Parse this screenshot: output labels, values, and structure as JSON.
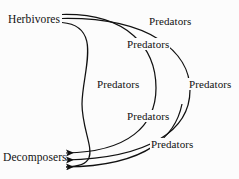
{
  "figure": {
    "background_color": "#fcfcfc",
    "line_color": "#111111",
    "type": "food-chain-diagram"
  },
  "nodes": {
    "source": {
      "label": "Herbivores",
      "x": 8,
      "y": 13
    },
    "sink": {
      "label": "Decomposers",
      "x": 3,
      "y": 152
    }
  },
  "chain_stages": [
    {
      "label": "Predators",
      "x": 148,
      "y": 15
    },
    {
      "label": "Predators",
      "x": 126,
      "y": 38
    },
    {
      "label": "Predators",
      "x": 96,
      "y": 78
    },
    {
      "label": "Predators",
      "x": 188,
      "y": 78
    },
    {
      "label": "Predators",
      "x": 126,
      "y": 110
    },
    {
      "label": "Predators",
      "x": 150,
      "y": 138
    }
  ],
  "arcs": [
    {
      "name": "inner-arc",
      "from": "Herbivores",
      "to": "Decomposers",
      "stages": 1
    },
    {
      "name": "middle-arc",
      "from": "Herbivores",
      "to": "Decomposers",
      "stages": 2
    },
    {
      "name": "outer-arc",
      "from": "Herbivores",
      "to": "Decomposers",
      "stages": 2
    }
  ]
}
